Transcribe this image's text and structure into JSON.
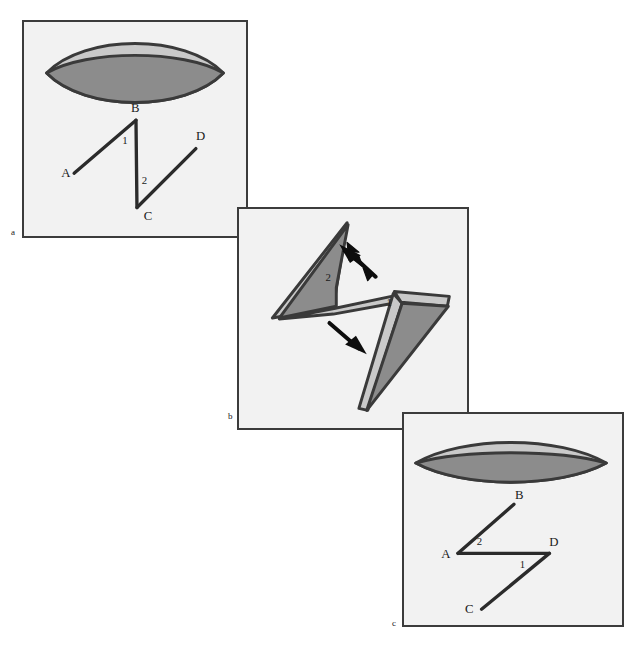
{
  "figure": {
    "panels": [
      {
        "id": "a",
        "letter": "a",
        "labels": {
          "point_a": "A",
          "point_b": "B",
          "point_c": "C",
          "point_d": "D",
          "angle_1": "1",
          "angle_2": "2"
        }
      },
      {
        "id": "b",
        "letter": "b",
        "labels": {
          "angle_1": "1",
          "angle_2": "2"
        },
        "arrows": [
          {
            "name": "upper-left-arrow",
            "direction": "up-left"
          },
          {
            "name": "lower-right-arrow",
            "direction": "down-right"
          }
        ]
      },
      {
        "id": "c",
        "letter": "c",
        "labels": {
          "point_a": "A",
          "point_b": "B",
          "point_c": "C",
          "point_d": "D",
          "angle_1": "1",
          "angle_2": "2"
        }
      }
    ],
    "caption": "",
    "colors": {
      "panel_background": "#f2f2f2",
      "panel_border": "#3c3c3c",
      "shape_outline": "#3a3a3a",
      "shape_fill_dark": "#8c8c8c",
      "shape_fill_light": "#c9c9c9",
      "line_stroke": "#2b2b2b",
      "label_text": "#1a1a1a"
    }
  }
}
